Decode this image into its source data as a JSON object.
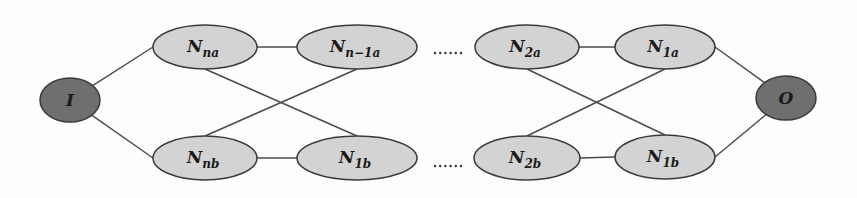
{
  "diagram": {
    "type": "network-graph",
    "colors": {
      "inner_fill": "#d3d3d3",
      "terminal_fill": "#6f6f6f",
      "stroke": "#3a3a3a",
      "edge": "#4a4a4a",
      "text": "#1a1a1a"
    },
    "nodes": [
      {
        "id": "I",
        "main": "I",
        "sub": "",
        "cx": 70,
        "cy": 100,
        "rx": 30,
        "ry": 22,
        "kind": "terminal"
      },
      {
        "id": "Nna",
        "main": "N",
        "sub": "na",
        "cx": 205,
        "cy": 47,
        "rx": 52,
        "ry": 22,
        "kind": "inner"
      },
      {
        "id": "Nnb",
        "main": "N",
        "sub": "nb",
        "cx": 205,
        "cy": 158,
        "rx": 52,
        "ry": 22,
        "kind": "inner"
      },
      {
        "id": "Nn-1a",
        "main": "N",
        "sub": "n−1a",
        "cx": 357,
        "cy": 47,
        "rx": 60,
        "ry": 22,
        "kind": "inner"
      },
      {
        "id": "N1b_left",
        "main": "N",
        "sub": "1b",
        "cx": 357,
        "cy": 158,
        "rx": 60,
        "ry": 22,
        "kind": "inner"
      },
      {
        "id": "N2a",
        "main": "N",
        "sub": "2a",
        "cx": 527,
        "cy": 47,
        "rx": 52,
        "ry": 22,
        "kind": "inner"
      },
      {
        "id": "N2b",
        "main": "N",
        "sub": "2b",
        "cx": 527,
        "cy": 158,
        "rx": 53,
        "ry": 22,
        "kind": "inner"
      },
      {
        "id": "N1a",
        "main": "N",
        "sub": "1a",
        "cx": 665,
        "cy": 47,
        "rx": 50,
        "ry": 22,
        "kind": "inner"
      },
      {
        "id": "N1b_right",
        "main": "N",
        "sub": "1b",
        "cx": 665,
        "cy": 157,
        "rx": 50,
        "ry": 22,
        "kind": "inner"
      },
      {
        "id": "O",
        "main": "O",
        "sub": "",
        "cx": 786,
        "cy": 98,
        "rx": 30,
        "ry": 22,
        "kind": "terminal"
      }
    ],
    "edges": [
      {
        "from": "I",
        "to": "Nna"
      },
      {
        "from": "I",
        "to": "Nnb"
      },
      {
        "from": "Nna",
        "to": "Nn-1a"
      },
      {
        "from": "Nnb",
        "to": "N1b_left"
      },
      {
        "from": "Nna",
        "to": "N1b_left"
      },
      {
        "from": "Nnb",
        "to": "Nn-1a"
      },
      {
        "from": "N2a",
        "to": "N1a"
      },
      {
        "from": "N2b",
        "to": "N1b_right"
      },
      {
        "from": "N2a",
        "to": "N1b_right"
      },
      {
        "from": "N2b",
        "to": "N1a"
      },
      {
        "from": "N1a",
        "to": "O"
      },
      {
        "from": "N1b_right",
        "to": "O"
      }
    ],
    "ellipsis": [
      {
        "label": "······",
        "x": 448,
        "y": 53
      },
      {
        "label": "······",
        "x": 448,
        "y": 166
      }
    ]
  }
}
